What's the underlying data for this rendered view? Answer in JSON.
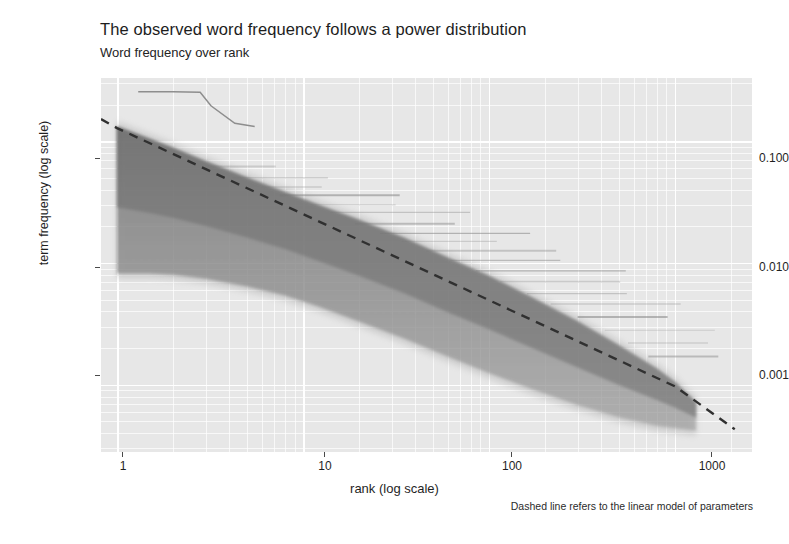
{
  "title": "The observed word frequency follows a power distribution",
  "subtitle": "Word frequency over rank",
  "caption": "Dashed line refers to the linear model of parameters",
  "axes": {
    "x_label": "rank (log scale)",
    "y_label": "term frequency (log scale)",
    "x_ticks": [
      "1",
      "10",
      "100",
      "1000"
    ],
    "y_ticks": [
      "0.100",
      "0.010",
      "0.001"
    ]
  },
  "colors": {
    "panel_background": "#e7e7e7",
    "gridline": "#ffffff",
    "band": "#6f6f6f",
    "dashed_line": "#303030",
    "text": "#1f1f1f"
  },
  "chart_data": {
    "type": "line",
    "title": "The observed word frequency follows a power distribution",
    "subtitle": "Word frequency over rank",
    "xlabel": "rank (log scale)",
    "ylabel": "term frequency (log scale)",
    "xscale": "log",
    "yscale": "log",
    "xlim": [
      0.82,
      2600
    ],
    "ylim": [
      0.00028,
      0.33
    ],
    "x_tick_values": [
      1,
      10,
      100,
      1000
    ],
    "y_tick_values": [
      0.1,
      0.01,
      0.001
    ],
    "grid": "major and minor white gridlines on gray panel",
    "legend": "none",
    "annotations": [
      "Dashed line refers to the linear model of parameters"
    ],
    "series": [
      {
        "name": "term frequency band (upper envelope)",
        "type": "area-envelope",
        "x": [
          1,
          1.5,
          2,
          3,
          5,
          8,
          12,
          20,
          35,
          60,
          100,
          170,
          300,
          500,
          800,
          1000,
          1300
        ],
        "y": [
          0.132,
          0.104,
          0.088,
          0.068,
          0.05,
          0.038,
          0.03,
          0.0225,
          0.016,
          0.011,
          0.0078,
          0.0052,
          0.0033,
          0.0021,
          0.00135,
          0.00105,
          0.00072
        ]
      },
      {
        "name": "term frequency band (lower envelope)",
        "type": "area-envelope",
        "x": [
          1,
          1.5,
          2,
          3,
          5,
          8,
          12,
          20,
          35,
          60,
          100,
          170,
          300,
          500,
          800,
          1000,
          1300
        ],
        "y": [
          0.0082,
          0.0082,
          0.008,
          0.0074,
          0.0064,
          0.0054,
          0.0044,
          0.0033,
          0.0024,
          0.0017,
          0.00125,
          0.00092,
          0.00068,
          0.00054,
          0.00046,
          0.00044,
          0.00042
        ]
      },
      {
        "name": "linear model fit (dashed)",
        "type": "line",
        "style": "dashed",
        "x": [
          0.82,
          1,
          10,
          100,
          1000,
          2100
        ],
        "y": [
          0.152,
          0.128,
          0.0252,
          0.00495,
          0.00097,
          0.00043
        ],
        "slope_loglog": -0.707,
        "intercept_at_rank_1": 0.128
      },
      {
        "name": "outlier trace (upper-left stepped line)",
        "type": "line",
        "x": [
          1.3,
          2.0,
          2.8,
          3.2,
          4.3,
          5.5
        ],
        "y": [
          0.255,
          0.255,
          0.252,
          0.195,
          0.14,
          0.132
        ]
      }
    ]
  }
}
